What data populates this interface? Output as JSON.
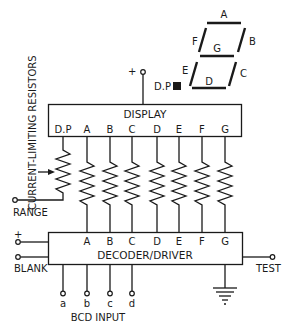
{
  "labels": {
    "resistors_caption": "CURRENT-LIMITING RESISTORS",
    "display_title": "DISPLAY",
    "decoder_title": "DECODER/DRIVER",
    "range": "RANGE",
    "blank": "BLANK",
    "plus_supply_top": "+",
    "plus_supply_left": "+",
    "test": "TEST",
    "bcd_input": "BCD INPUT",
    "dp_indicator": "D.P"
  },
  "display_pins": [
    "D.P",
    "A",
    "B",
    "C",
    "D",
    "E",
    "F",
    "G"
  ],
  "decoder_pins": [
    "A",
    "B",
    "C",
    "D",
    "E",
    "F",
    "G"
  ],
  "bcd_inputs": [
    "a",
    "b",
    "c",
    "d"
  ],
  "segments": {
    "A": "A",
    "B": "B",
    "C": "C",
    "D": "D",
    "E": "E",
    "F": "F",
    "G": "G"
  },
  "colors": {
    "ink": "#1a1a1a",
    "background": "#ffffff"
  }
}
